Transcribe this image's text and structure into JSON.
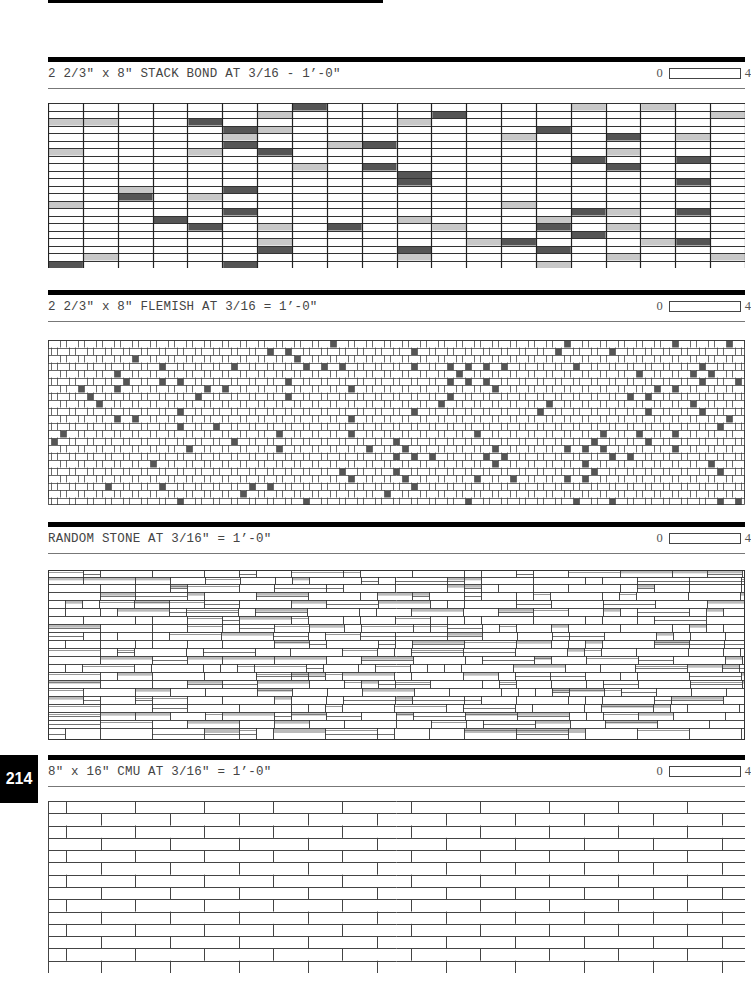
{
  "page_number": "214",
  "sections": [
    {
      "title": "2 2/3\" x 8\" STACK BOND AT 3/16 - 1’-0\"",
      "scale": {
        "start": "0",
        "end": "4"
      },
      "pattern": {
        "type": "stack",
        "cols": 20,
        "rows": 22,
        "dark": "#555555",
        "light": "#c8c8c8"
      }
    },
    {
      "title": "2 2/3\" x 8\" FLEMISH AT 3/16 = 1’-0\"",
      "scale": {
        "start": "0",
        "end": "4"
      },
      "pattern": {
        "type": "flemish",
        "rows": 22,
        "dark": "#555555"
      }
    },
    {
      "title": "RANDOM STONE AT 3/16\" = 1’-0\"",
      "scale": {
        "start": "0",
        "end": "4"
      },
      "pattern": {
        "type": "stone",
        "light": "#bbbbbb"
      }
    },
    {
      "title": "8\" x 16\" CMU AT 3/16\" = 1’-0\"",
      "scale": {
        "start": "0",
        "end": "4"
      },
      "pattern": {
        "type": "cmu",
        "rows": 14,
        "unit": 69
      }
    }
  ]
}
